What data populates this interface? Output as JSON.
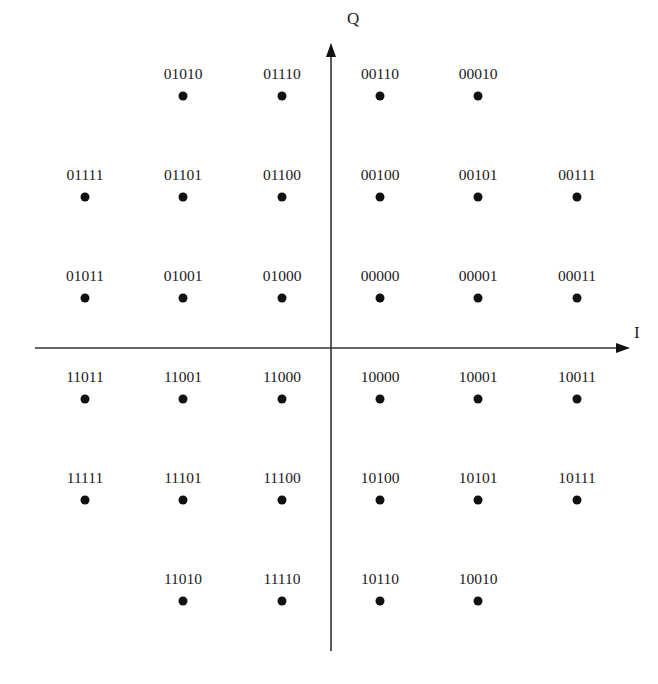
{
  "colors": {
    "background": "#ffffff",
    "axis": "#333333",
    "point": "#111111",
    "text": "#222222"
  },
  "axes": {
    "i_label": "I",
    "q_label": "Q",
    "origin": [
      331,
      348
    ],
    "h_axis": {
      "x1": 35,
      "x2": 628,
      "y": 348
    },
    "v_axis": {
      "y1": 45,
      "y2": 651,
      "x": 331
    }
  },
  "grid": {
    "columns_x": [
      85,
      183,
      282,
      380,
      478,
      577
    ],
    "rows_y": [
      96,
      197,
      298,
      399,
      500,
      601
    ],
    "label_offset_y": -17,
    "dot_radius": 4.5
  },
  "chart_data": {
    "type": "scatter",
    "title": "",
    "xlabel": "I",
    "ylabel": "Q",
    "points": [
      {
        "label": "01010",
        "col": 1,
        "row": 0,
        "i": -3,
        "q": 5
      },
      {
        "label": "01110",
        "col": 2,
        "row": 0,
        "i": -1,
        "q": 5
      },
      {
        "label": "00110",
        "col": 3,
        "row": 0,
        "i": 1,
        "q": 5
      },
      {
        "label": "00010",
        "col": 4,
        "row": 0,
        "i": 3,
        "q": 5
      },
      {
        "label": "01111",
        "col": 0,
        "row": 1,
        "i": -5,
        "q": 3
      },
      {
        "label": "01101",
        "col": 1,
        "row": 1,
        "i": -3,
        "q": 3
      },
      {
        "label": "01100",
        "col": 2,
        "row": 1,
        "i": -1,
        "q": 3
      },
      {
        "label": "00100",
        "col": 3,
        "row": 1,
        "i": 1,
        "q": 3
      },
      {
        "label": "00101",
        "col": 4,
        "row": 1,
        "i": 3,
        "q": 3
      },
      {
        "label": "00111",
        "col": 5,
        "row": 1,
        "i": 5,
        "q": 3
      },
      {
        "label": "01011",
        "col": 0,
        "row": 2,
        "i": -5,
        "q": 1
      },
      {
        "label": "01001",
        "col": 1,
        "row": 2,
        "i": -3,
        "q": 1
      },
      {
        "label": "01000",
        "col": 2,
        "row": 2,
        "i": -1,
        "q": 1
      },
      {
        "label": "00000",
        "col": 3,
        "row": 2,
        "i": 1,
        "q": 1
      },
      {
        "label": "00001",
        "col": 4,
        "row": 2,
        "i": 3,
        "q": 1
      },
      {
        "label": "00011",
        "col": 5,
        "row": 2,
        "i": 5,
        "q": 1
      },
      {
        "label": "11011",
        "col": 0,
        "row": 3,
        "i": -5,
        "q": -1
      },
      {
        "label": "11001",
        "col": 1,
        "row": 3,
        "i": -3,
        "q": -1
      },
      {
        "label": "11000",
        "col": 2,
        "row": 3,
        "i": -1,
        "q": -1
      },
      {
        "label": "10000",
        "col": 3,
        "row": 3,
        "i": 1,
        "q": -1
      },
      {
        "label": "10001",
        "col": 4,
        "row": 3,
        "i": 3,
        "q": -1
      },
      {
        "label": "10011",
        "col": 5,
        "row": 3,
        "i": 5,
        "q": -1
      },
      {
        "label": "11111",
        "col": 0,
        "row": 4,
        "i": -5,
        "q": -3
      },
      {
        "label": "11101",
        "col": 1,
        "row": 4,
        "i": -3,
        "q": -3
      },
      {
        "label": "11100",
        "col": 2,
        "row": 4,
        "i": -1,
        "q": -3
      },
      {
        "label": "10100",
        "col": 3,
        "row": 4,
        "i": 1,
        "q": -3
      },
      {
        "label": "10101",
        "col": 4,
        "row": 4,
        "i": 3,
        "q": -3
      },
      {
        "label": "10111",
        "col": 5,
        "row": 4,
        "i": 5,
        "q": -3
      },
      {
        "label": "11010",
        "col": 1,
        "row": 5,
        "i": -3,
        "q": -5
      },
      {
        "label": "11110",
        "col": 2,
        "row": 5,
        "i": -1,
        "q": -5
      },
      {
        "label": "10110",
        "col": 3,
        "row": 5,
        "i": 1,
        "q": -5
      },
      {
        "label": "10010",
        "col": 4,
        "row": 5,
        "i": 3,
        "q": -5
      }
    ],
    "xlim": [
      -6,
      6
    ],
    "ylim": [
      -6,
      6
    ],
    "grid": false,
    "legend": "none"
  }
}
